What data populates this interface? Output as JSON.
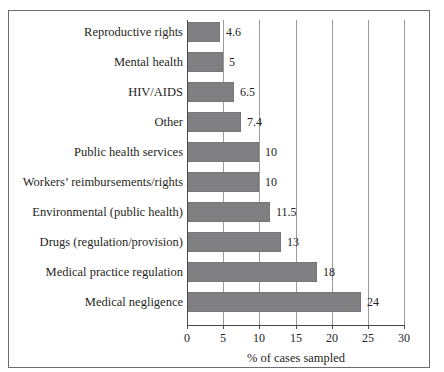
{
  "figure": {
    "top_cut_text": "",
    "frame_color": "#6d6d70",
    "bar_color": "#808083",
    "grid_color": "#9a9a9d",
    "axis_color": "#4a4a4d"
  },
  "chart_data": {
    "type": "bar",
    "orientation": "horizontal",
    "title": "",
    "xlabel": "% of cases sampled",
    "ylabel": "",
    "xlim": [
      0,
      30
    ],
    "xticks": [
      0,
      5,
      10,
      15,
      20,
      25,
      30
    ],
    "grid": "vertical",
    "legend": "none",
    "categories": [
      "Reproductive rights",
      "Mental health",
      "HIV/AIDS",
      "Other",
      "Public health services",
      "Workers’ reimbursements/rights",
      "Environmental (public health)",
      "Drugs (regulation/provision)",
      "Medical practice regulation",
      "Medical negligence"
    ],
    "values": [
      4.6,
      5,
      6.5,
      7.4,
      10,
      10,
      11.5,
      13,
      18,
      24
    ],
    "value_labels": [
      "4.6",
      "5",
      "6.5",
      "7.4",
      "10",
      "10",
      "11.5",
      "13",
      "18",
      "24"
    ]
  }
}
